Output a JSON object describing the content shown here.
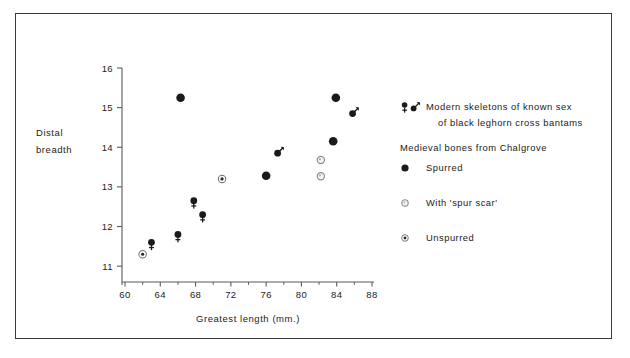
{
  "figure": {
    "x_axis_title": "Greatest length (mm.)",
    "y_axis_title_line1": "Distal",
    "y_axis_title_line2": "breadth"
  },
  "legend": {
    "modern_line1": "Modern skeletons of known sex",
    "modern_line2": "of black leghorn cross bantams",
    "medieval_heading": "Medieval bones from Chalgrove",
    "spurred_label": "Spurred",
    "spur_scar_label": "With 'spur scar'",
    "unspurred_label": "Unspurred",
    "female_symbol": "female-symbol",
    "male_symbol": "male-symbol",
    "spurred_symbol": "filled-circle-marker",
    "spur_scar_symbol": "open-circle-marker",
    "unspurred_symbol": "dotted-circle-marker"
  },
  "colors": {
    "frame": "#3a3a3a",
    "axis": "#5a5a5a",
    "marker_fill": "#1a1a1a",
    "marker_open_stroke": "#8d8d8d",
    "text": "#222222"
  },
  "chart_data": {
    "type": "scatter",
    "title": "",
    "xlabel": "Greatest length (mm.)",
    "ylabel": "Distal breadth",
    "xlim": [
      60,
      88
    ],
    "ylim": [
      10.6,
      16
    ],
    "xticks": [
      60,
      64,
      68,
      72,
      76,
      80,
      84,
      88
    ],
    "xticklabels": [
      "60",
      "64",
      "68",
      "72",
      "76",
      "80",
      "84",
      "88"
    ],
    "xminorticks": [
      62,
      66,
      70,
      74,
      78,
      82,
      86
    ],
    "yticks": [
      11,
      12,
      13,
      14,
      15,
      16
    ],
    "yticklabels": [
      "11",
      "12",
      "13",
      "14",
      "15",
      "16"
    ],
    "grid": false,
    "legend_position": "right",
    "series": [
      {
        "name": "Modern female (black leghorn cross bantams)",
        "marker": "female-symbol",
        "points": [
          {
            "x": 63.0,
            "y": 11.6
          },
          {
            "x": 66.0,
            "y": 11.8
          },
          {
            "x": 67.8,
            "y": 12.65
          },
          {
            "x": 68.8,
            "y": 12.3
          }
        ]
      },
      {
        "name": "Modern male (black leghorn cross bantams)",
        "marker": "male-symbol",
        "points": [
          {
            "x": 77.3,
            "y": 13.85
          },
          {
            "x": 85.8,
            "y": 14.85
          }
        ]
      },
      {
        "name": "Spurred",
        "marker": "filled-circle-marker",
        "points": [
          {
            "x": 66.3,
            "y": 15.25
          },
          {
            "x": 76.0,
            "y": 13.28
          },
          {
            "x": 83.6,
            "y": 14.15
          },
          {
            "x": 83.9,
            "y": 15.25
          }
        ]
      },
      {
        "name": "With 'spur scar'",
        "marker": "open-circle-marker",
        "points": [
          {
            "x": 82.2,
            "y": 13.68
          },
          {
            "x": 82.2,
            "y": 13.27
          }
        ]
      },
      {
        "name": "Unspurred",
        "marker": "dotted-circle-marker",
        "points": [
          {
            "x": 62.0,
            "y": 11.3
          },
          {
            "x": 71.0,
            "y": 13.2
          }
        ]
      }
    ]
  }
}
